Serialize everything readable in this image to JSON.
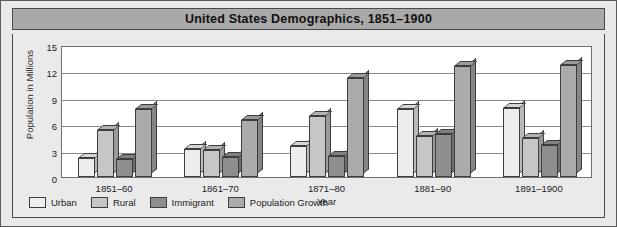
{
  "chart_data": {
    "type": "bar",
    "title": "United States Demographics, 1851–1900",
    "xlabel": "Year",
    "ylabel": "Population in Millions",
    "categories": [
      "1851–60",
      "1861–70",
      "1871–80",
      "1881–90",
      "1891–1900"
    ],
    "yticks": [
      0,
      3,
      6,
      9,
      12,
      15
    ],
    "ylim": [
      0,
      15
    ],
    "grid": true,
    "legend_position": "bottom-left",
    "series": [
      {
        "name": "Urban",
        "color": "#ededed",
        "values": [
          2.2,
          3.2,
          3.5,
          7.7,
          7.8
        ]
      },
      {
        "name": "Rural",
        "color": "#c6c6c6",
        "values": [
          5.3,
          3.1,
          6.9,
          4.7,
          4.4
        ]
      },
      {
        "name": "Immigrant",
        "color": "#8e8e8e",
        "values": [
          2.0,
          2.3,
          2.4,
          4.9,
          3.6
        ]
      },
      {
        "name": "Population Growth",
        "color": "#ababab",
        "values": [
          7.7,
          6.5,
          11.3,
          12.6,
          12.7
        ]
      }
    ]
  },
  "colors": {
    "frame_border": "#5a5a5a",
    "title_bar_background": "#a9a9a9",
    "panel_background": "#eaeaea",
    "plot_background": "#ffffff",
    "gridline": "#8a8a8a",
    "bar_outline": "#3d3d3d"
  }
}
